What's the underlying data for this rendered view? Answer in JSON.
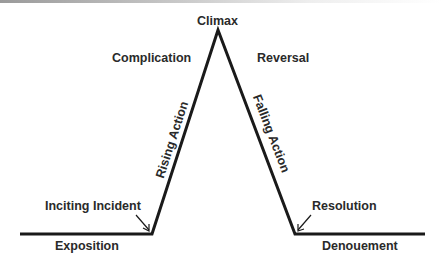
{
  "diagram": {
    "type": "plot-structure",
    "labels": {
      "climax": "Climax",
      "complication": "Complication",
      "reversal": "Reversal",
      "rising_action": "Rising Action",
      "falling_action": "Falling Action",
      "inciting_incident": "Inciting Incident",
      "resolution": "Resolution",
      "exposition": "Exposition",
      "denouement": "Denouement"
    },
    "colors": {
      "line": "#1a1a1a",
      "text": "#2a2a2a",
      "background": "#ffffff"
    }
  }
}
